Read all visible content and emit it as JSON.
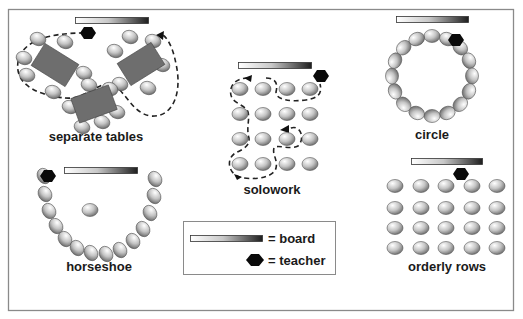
{
  "colors": {
    "frame": "#8a8a8a",
    "table": "#6e6e6e",
    "teacher": "#0a0a0a",
    "seat_light": "#ffffff",
    "seat_dark": "#6a6a6a",
    "board_light": "#ffffff",
    "board_dark": "#1e1e1e"
  },
  "arrangements": [
    {
      "id": "separate_tables",
      "label": "separate tables"
    },
    {
      "id": "solowork",
      "label": "solowork"
    },
    {
      "id": "circle",
      "label": "circle"
    },
    {
      "id": "horseshoe",
      "label": "horseshoe"
    },
    {
      "id": "orderly_rows",
      "label": "orderly rows"
    }
  ],
  "legend": {
    "board_label": "= board",
    "teacher_label": "= teacher"
  },
  "layout": {
    "separate_tables": {
      "board": [
        75,
        17,
        73,
        6
      ],
      "teacher": [
        88,
        33
      ],
      "tables": [
        {
          "cx": 55,
          "cy": 65,
          "w": 40,
          "h": 26,
          "rot": 32,
          "seats": [
            [
              38,
              39
            ],
            [
              65,
              42
            ],
            [
              24,
              58
            ],
            [
              84,
              73
            ],
            [
              27,
              75
            ],
            [
              53,
              92
            ]
          ]
        },
        {
          "cx": 141,
          "cy": 64,
          "w": 40,
          "h": 26,
          "rot": -32,
          "seats": [
            [
              130,
              37
            ],
            [
              153,
              41
            ],
            [
              115,
              51
            ],
            [
              162,
              65
            ],
            [
              120,
              84
            ],
            [
              148,
              88
            ]
          ]
        },
        {
          "cx": 94,
          "cy": 104,
          "w": 40,
          "h": 26,
          "rot": -20,
          "seats": [
            [
              89,
              85
            ],
            [
              110,
              89
            ],
            [
              70,
              107
            ],
            [
              117,
              112
            ],
            [
              82,
              127
            ],
            [
              102,
              122
            ]
          ]
        }
      ]
    },
    "solowork": {
      "board": [
        238,
        62,
        73,
        6
      ],
      "teacher": [
        321,
        76
      ],
      "cols": [
        240,
        263,
        287,
        310
      ],
      "rows": [
        89,
        114,
        139,
        164
      ]
    },
    "circle": {
      "board": [
        396,
        16,
        72,
        6
      ],
      "teacher": [
        456,
        40
      ],
      "center": [
        432,
        76
      ],
      "radius": 40,
      "seat_count": 16
    },
    "horseshoe": {
      "board": [
        64,
        167,
        73,
        6
      ],
      "teacher": [
        48,
        176
      ],
      "center_seat": [
        90,
        210
      ],
      "seats": [
        [
          44,
          176
        ],
        [
          45,
          194
        ],
        [
          49,
          211
        ],
        [
          56,
          226
        ],
        [
          65,
          239
        ],
        [
          77,
          248
        ],
        [
          91,
          253
        ],
        [
          106,
          254
        ],
        [
          120,
          250
        ],
        [
          133,
          241
        ],
        [
          143,
          229
        ],
        [
          150,
          213
        ],
        [
          154,
          196
        ],
        [
          155,
          179
        ]
      ]
    },
    "orderly_rows": {
      "board": [
        411,
        158,
        71,
        6
      ],
      "teacher": [
        461,
        174
      ],
      "cols": [
        395,
        421,
        446,
        472,
        497
      ],
      "rows": [
        186,
        208,
        228,
        248
      ]
    },
    "legend_box": [
      183,
      221,
      152,
      53
    ]
  }
}
